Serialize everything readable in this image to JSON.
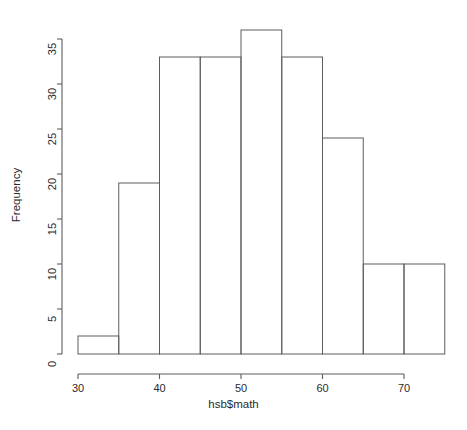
{
  "chart_data": {
    "type": "bar",
    "subtype": "histogram",
    "title": "",
    "xlabel": "hsb$math",
    "ylabel": "Frequency",
    "xlim": [
      30,
      75
    ],
    "ylim": [
      0,
      36
    ],
    "grid": false,
    "legend": null,
    "bin_width": 5,
    "bin_edges": [
      30,
      35,
      40,
      45,
      50,
      55,
      60,
      65,
      70,
      75
    ],
    "categories": [
      "30-35",
      "35-40",
      "40-45",
      "45-50",
      "50-55",
      "55-60",
      "60-65",
      "65-70",
      "70-75"
    ],
    "values": [
      2,
      19,
      33,
      33,
      36,
      33,
      24,
      10,
      10
    ],
    "xticks": [
      30,
      40,
      50,
      60,
      70
    ],
    "xtick_labels": [
      "30",
      "40",
      "50",
      "60",
      "70"
    ],
    "yticks": [
      0,
      5,
      10,
      15,
      20,
      25,
      30,
      35
    ],
    "ytick_labels": [
      "0",
      "5",
      "10",
      "15",
      "20",
      "25",
      "30",
      "35"
    ],
    "colors": {
      "axis": "#5d5d5d",
      "bar_stroke": "#5d5d5d",
      "bar_fill": "none",
      "background": "#ffffff",
      "text": "#2b2b2b"
    }
  }
}
